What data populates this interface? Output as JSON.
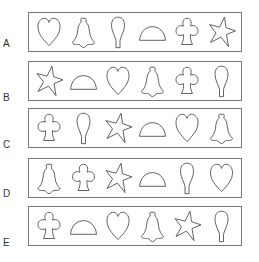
{
  "rows": [
    {
      "label": "A",
      "top": 12,
      "label_top": 39,
      "shapes": [
        "heart",
        "bell",
        "balloon",
        "semicircle",
        "club",
        "star"
      ]
    },
    {
      "label": "B",
      "top": 61,
      "label_top": 93,
      "shapes": [
        "star",
        "semicircle",
        "heart",
        "bell",
        "club",
        "balloon"
      ]
    },
    {
      "label": "C",
      "top": 108,
      "label_top": 140,
      "shapes": [
        "club",
        "balloon",
        "star",
        "semicircle",
        "heart",
        "bell"
      ]
    },
    {
      "label": "D",
      "top": 158,
      "label_top": 189,
      "shapes": [
        "bell",
        "club",
        "star",
        "semicircle",
        "balloon",
        "heart"
      ]
    },
    {
      "label": "E",
      "top": 206,
      "label_top": 238,
      "shapes": [
        "club",
        "semicircle",
        "heart",
        "bell",
        "star",
        "balloon"
      ]
    }
  ],
  "colors": {
    "stroke": "#555555",
    "border": "#777777",
    "background": "#ffffff"
  }
}
